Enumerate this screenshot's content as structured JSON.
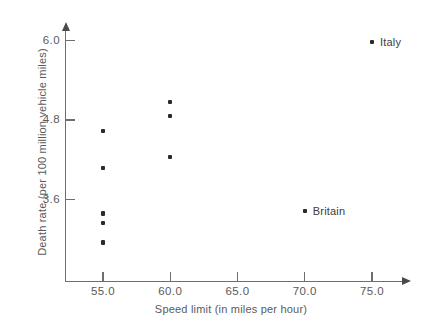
{
  "chart_data": {
    "type": "scatter",
    "title": "",
    "xlabel": "Speed limit (in miles per hour)",
    "ylabel": "Death rate (per 100 million vehicle miles)",
    "xlim": [
      52.0,
      77.5
    ],
    "ylim": [
      2.55,
      6.25
    ],
    "xticks": [
      "55.0",
      "60.0",
      "65.0",
      "70.0",
      "75.0"
    ],
    "xtick_values": [
      55.0,
      60.0,
      65.0,
      70.0,
      75.0
    ],
    "yticks": [
      "6.0",
      "4.8",
      "3.6"
    ],
    "ytick_values": [
      6.0,
      4.8,
      3.6
    ],
    "grid": false,
    "legend": false,
    "axis_arrows": true,
    "series": [
      {
        "name": "countries",
        "marker": "square-dot",
        "color": "#2b2b2b",
        "points": [
          {
            "x": 55.0,
            "y": 4.63,
            "label": ""
          },
          {
            "x": 55.0,
            "y": 4.07,
            "label": ""
          },
          {
            "x": 55.0,
            "y": 3.39,
            "label": ""
          },
          {
            "x": 55.0,
            "y": 3.25,
            "label": ""
          },
          {
            "x": 55.0,
            "y": 2.95,
            "label": ""
          },
          {
            "x": 60.0,
            "y": 5.07,
            "label": ""
          },
          {
            "x": 60.0,
            "y": 4.86,
            "label": ""
          },
          {
            "x": 60.0,
            "y": 4.24,
            "label": ""
          },
          {
            "x": 70.0,
            "y": 3.43,
            "label": "Britain"
          },
          {
            "x": 75.0,
            "y": 5.98,
            "label": "Italy"
          }
        ]
      }
    ],
    "annotations": [
      {
        "text": "Britain",
        "x": 70.0,
        "y": 3.43
      },
      {
        "text": "Italy",
        "x": 75.0,
        "y": 5.98
      }
    ]
  },
  "colors": {
    "background": "#ffffff",
    "axis": "#6e6e6e",
    "marker": "#2b2b2b",
    "text": "#5a5a5a"
  }
}
